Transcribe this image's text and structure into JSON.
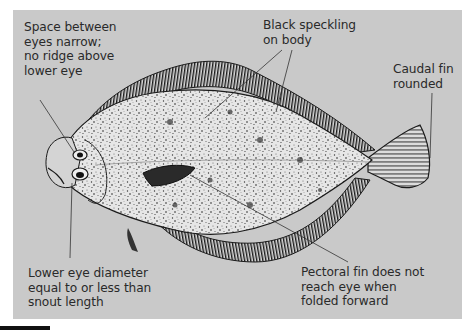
{
  "figure": {
    "annotations": [
      {
        "id": "eyes",
        "text": "Space between\neyes narrow;\nno ridge above\nlower eye"
      },
      {
        "id": "speckling",
        "text": "Black speckling\non body"
      },
      {
        "id": "caudal",
        "text": "Caudal fin\nrounded"
      },
      {
        "id": "lower-eye",
        "text": "Lower eye diameter\nequal to or less than\nsnout length"
      },
      {
        "id": "pectoral",
        "text": "Pectoral fin does not\nreach eye when\nfolded forward"
      }
    ]
  },
  "colors": {
    "panel": "#c9c9c9",
    "ink": "#1a1a1a",
    "body": "#e4e4e4",
    "text": "#2a2a2a"
  }
}
